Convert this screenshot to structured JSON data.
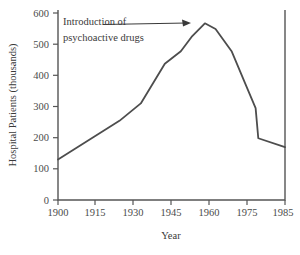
{
  "chart_data": {
    "type": "line",
    "title": "",
    "xlabel": "Year",
    "ylabel": "Hospital Patients (thousands)",
    "xlim": [
      1900,
      1985
    ],
    "ylim": [
      0,
      600
    ],
    "grid": false,
    "legend": "none",
    "xticks": [
      "1900",
      "1915",
      "1930",
      "1945",
      "1960",
      "1975",
      "1985"
    ],
    "xtick_values": [
      1900,
      1915,
      1930,
      1945,
      1960,
      1975,
      1985
    ],
    "yticks": [
      "0",
      "100",
      "200",
      "300",
      "400",
      "500",
      "600"
    ],
    "ytick_values": [
      0,
      100,
      200,
      300,
      400,
      500,
      600
    ],
    "series": [
      {
        "name": "Hospital Patients",
        "color": "#4d4d4d",
        "x": [
          1900,
          1923,
          1931,
          1940,
          1943,
          1946,
          1950,
          1955,
          1959,
          1965,
          1970,
          1974,
          1975,
          1985
        ],
        "values": [
          128,
          250,
          305,
          430,
          450,
          470,
          515,
          558,
          540,
          470,
          370,
          290,
          195,
          167
        ]
      }
    ],
    "annotations": [
      {
        "name": "introduction-annotation",
        "text_line1": "Introduction of",
        "text_line2": "psychoactive drugs",
        "arrow_from": [
          1918,
          580
        ],
        "arrow_to": [
          1953,
          570
        ]
      }
    ]
  },
  "axes": {
    "line_color": "#4d4d4d",
    "text_color": "#3a3a3a"
  }
}
